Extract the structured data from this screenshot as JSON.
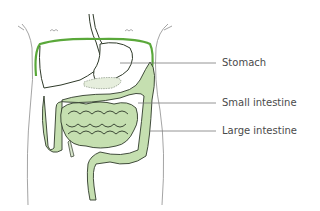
{
  "diagram": {
    "type": "anatomical-illustration",
    "colors": {
      "organ_fill": "#c5dfb0",
      "organ_stroke": "#2f3a2a",
      "highlight_outline": "#5aa83a",
      "body_outline": "#9a9a9a",
      "leader_line": "#7a7a7a",
      "label_text": "#4a4a4a"
    },
    "labels": [
      {
        "id": "stomach",
        "text": "Stomach"
      },
      {
        "id": "small-intestine",
        "text": "Small intestine"
      },
      {
        "id": "large-intestine",
        "text": "Large intestine"
      }
    ]
  }
}
